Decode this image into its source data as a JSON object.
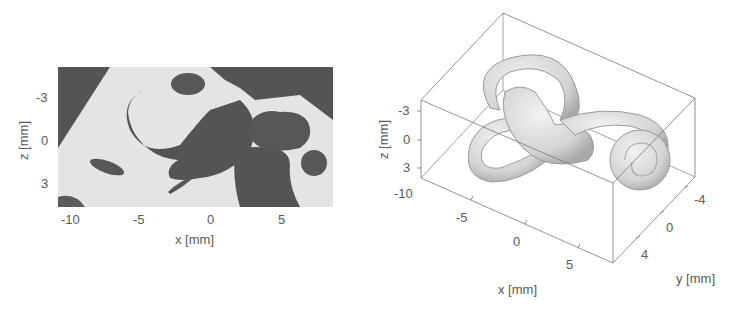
{
  "figure": {
    "left_panel": {
      "title": "CT slice (x–z plane)",
      "xlabel": "x [mm]",
      "ylabel": "z [mm]",
      "xticks": [
        "-10",
        "-5",
        "0",
        "5"
      ],
      "yticks": [
        "-3",
        "0",
        "3"
      ],
      "colors": {
        "bone": "#e6e6e6",
        "cavity": "#555555"
      }
    },
    "right_panel": {
      "title": "3D inner ear surface render",
      "xlabel": "x [mm]",
      "ylabel": "y [mm]",
      "zlabel": "z [mm]",
      "xticks": [
        "-10",
        "-5",
        "0",
        "5"
      ],
      "yticks": [
        "-4",
        "0",
        "4"
      ],
      "zticks": [
        "-3",
        "0",
        "3"
      ],
      "colors": {
        "surface": "#d8d8d8",
        "box": "#888888"
      }
    }
  }
}
